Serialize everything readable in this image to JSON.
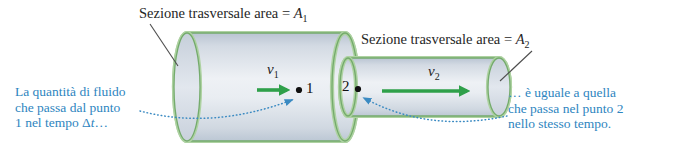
{
  "labels": {
    "section1_prefix": "Sezione trasversale area = ",
    "section1_var": "A",
    "section1_sub": "1",
    "section2_prefix": "Sezione trasversale area = ",
    "section2_var": "A",
    "section2_sub": "2",
    "v1_var": "v",
    "v1_sub": "1",
    "v2_var": "v",
    "v2_sub": "2",
    "point1": "1",
    "point2": "2"
  },
  "annotations": {
    "left": {
      "line1": "La quantità di fluido",
      "line2": "che passa dal punto",
      "line3_pre": "1 nel tempo Δ",
      "line3_var": "t",
      "line3_post": "…"
    },
    "right": {
      "line1": "… è uguale a quella",
      "line2": "che passa nel punto 2",
      "line3": "nello stesso tempo."
    }
  },
  "colors": {
    "annotation_blue": "#2e85c0",
    "arrow_green": "#2fa04a",
    "pipe_outline_light": "#aed2a2",
    "pipe_outline_dark": "#74ab6c",
    "pipe_fill_mid": "#eef1f5",
    "pipe_fill_edge": "#bcc7d4",
    "label_dark": "#262626"
  }
}
